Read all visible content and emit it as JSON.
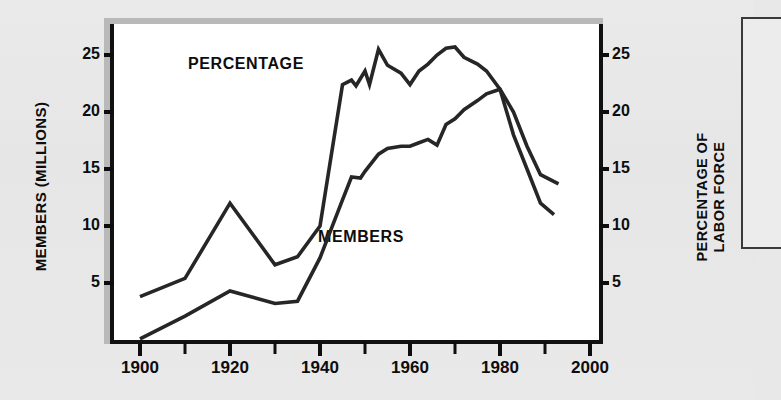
{
  "figure": {
    "background_color": "#e8e8e8",
    "plot_background": "#ffffff",
    "line_color": "#262626",
    "text_color": "#0d0d0d"
  },
  "labels": {
    "y_left_title": "MEMBERS (MILLIONS)",
    "y_right_title_line1": "PERCENTAGE OF",
    "y_right_title_line2": "LABOR FORCE",
    "series_percentage": "PERCENTAGE",
    "series_members": "MEMBERS"
  },
  "chart_data": {
    "type": "line",
    "title": "",
    "xlabel": "",
    "ylabel": "MEMBERS (MILLIONS)",
    "y2label": "PERCENTAGE OF LABOR FORCE",
    "xlim": [
      1896,
      2004
    ],
    "ylim": [
      0,
      27
    ],
    "y2lim": [
      0,
      27
    ],
    "grid": false,
    "legend": "inline-annotations",
    "xticks": [
      1900,
      1920,
      1940,
      1960,
      1980,
      2000
    ],
    "xtick_labels": [
      "1900",
      "1920",
      "1940",
      "1960",
      "1980",
      "2000"
    ],
    "xminor_ticks": [
      1910,
      1930,
      1950,
      1970,
      1990
    ],
    "yticks": [
      5,
      10,
      15,
      20,
      25
    ],
    "ytick_labels": [
      "5",
      "10",
      "15",
      "20",
      "25"
    ],
    "y2ticks": [
      5,
      10,
      15,
      20,
      25
    ],
    "y2tick_labels": [
      "5",
      "10",
      "15",
      "20",
      "25"
    ],
    "series": [
      {
        "name": "PERCENTAGE",
        "axis": "right",
        "unit": "percent of labor force",
        "x": [
          1900,
          1910,
          1920,
          1930,
          1935,
          1940,
          1945,
          1947,
          1948,
          1950,
          1951,
          1953,
          1955,
          1958,
          1960,
          1962,
          1964,
          1966,
          1968,
          1970,
          1972,
          1975,
          1977,
          1980,
          1983,
          1986,
          1989,
          1992
        ],
        "y": [
          3.8,
          5.4,
          12.0,
          6.6,
          7.3,
          10.0,
          22.4,
          22.8,
          22.3,
          23.6,
          22.4,
          25.5,
          24.1,
          23.4,
          22.4,
          23.6,
          24.2,
          25.0,
          25.6,
          25.7,
          24.8,
          24.2,
          23.6,
          22.0,
          18.0,
          15.0,
          12.0,
          11.0
        ]
      },
      {
        "name": "MEMBERS",
        "axis": "left",
        "unit": "millions",
        "x": [
          1900,
          1910,
          1920,
          1930,
          1935,
          1940,
          1945,
          1947,
          1949,
          1950,
          1953,
          1955,
          1958,
          1960,
          1962,
          1964,
          1966,
          1968,
          1970,
          1972,
          1975,
          1977,
          1980,
          1983,
          1986,
          1989,
          1993
        ],
        "y": [
          0.1,
          2.1,
          4.3,
          3.2,
          3.4,
          7.2,
          12.3,
          14.3,
          14.2,
          14.8,
          16.3,
          16.8,
          17.0,
          17.0,
          17.3,
          17.6,
          17.1,
          18.9,
          19.4,
          20.2,
          21.0,
          21.6,
          22.0,
          20.0,
          17.0,
          14.5,
          13.7
        ]
      }
    ]
  },
  "side_panel": {
    "name": "adjacent-cropped-panel"
  }
}
